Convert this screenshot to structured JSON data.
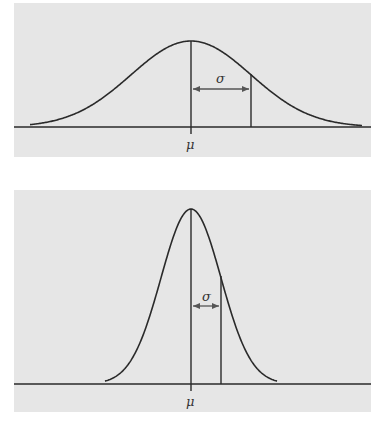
{
  "colors": {
    "panel_bg": "#e6e6e6",
    "line": "#2a2a2a",
    "page_bg": "#ffffff"
  },
  "panels": [
    {
      "id": "wide",
      "mean_label": "μ",
      "sigma_label": "σ"
    },
    {
      "id": "narrow",
      "mean_label": "μ",
      "sigma_label": "σ"
    }
  ],
  "chart_data": [
    {
      "type": "line",
      "title": "Normal distribution (large σ)",
      "description": "Bell curve with mean μ marked by a vertical line and one standard deviation σ shown by a double-headed arrow",
      "annotations": [
        "μ",
        "σ"
      ],
      "relative_sigma": 2,
      "relative_peak_height": 1
    },
    {
      "type": "line",
      "title": "Normal distribution (small σ)",
      "description": "Taller, narrower bell curve with same mean μ and smaller standard deviation σ",
      "annotations": [
        "μ",
        "σ"
      ],
      "relative_sigma": 1,
      "relative_peak_height": 2
    }
  ]
}
